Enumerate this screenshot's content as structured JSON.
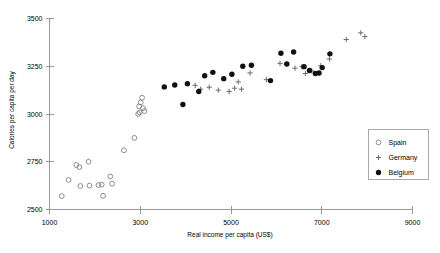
{
  "chart_data": {
    "type": "scatter",
    "title": "",
    "xlabel": "Real income per capita (US$)",
    "ylabel": "Calories per capita per day",
    "xlim": [
      1000,
      9000
    ],
    "ylim": [
      2500,
      3500
    ],
    "xticks": [
      1000,
      3000,
      5000,
      7000,
      9000
    ],
    "yticks": [
      2500,
      2750,
      3000,
      3250,
      3500
    ],
    "xtick_labels": [
      "1000",
      "3000",
      "5000",
      "7000",
      "9000"
    ],
    "ytick_labels": [
      "2500",
      "2750",
      "3000",
      "3250",
      "3500"
    ],
    "grid": false,
    "legend_position": "right-middle",
    "series": [
      {
        "name": "Spain",
        "marker": "open-circle",
        "color": "#8c8c8c",
        "points": [
          [
            1270,
            2570
          ],
          [
            1420,
            2655
          ],
          [
            1590,
            2733
          ],
          [
            1660,
            2722
          ],
          [
            1680,
            2623
          ],
          [
            1860,
            2750
          ],
          [
            1880,
            2625
          ],
          [
            2080,
            2628
          ],
          [
            2150,
            2630
          ],
          [
            2180,
            2572
          ],
          [
            2340,
            2673
          ],
          [
            2380,
            2635
          ],
          [
            2640,
            2810
          ],
          [
            2870,
            2875
          ],
          [
            2955,
            3000
          ],
          [
            2975,
            3040
          ],
          [
            2985,
            3008
          ],
          [
            3010,
            3060
          ],
          [
            3040,
            3085
          ],
          [
            3060,
            3030
          ],
          [
            3090,
            3015
          ]
        ]
      },
      {
        "name": "Germany",
        "marker": "plus",
        "color": "#6b6b6b",
        "points": [
          [
            4210,
            3150
          ],
          [
            4330,
            3130
          ],
          [
            4520,
            3140
          ],
          [
            4720,
            3125
          ],
          [
            4960,
            3118
          ],
          [
            5080,
            3135
          ],
          [
            5160,
            3168
          ],
          [
            5230,
            3130
          ],
          [
            5420,
            3215
          ],
          [
            5780,
            3180
          ],
          [
            6080,
            3265
          ],
          [
            6220,
            3262
          ],
          [
            6410,
            3240
          ],
          [
            6560,
            3248
          ],
          [
            6640,
            3212
          ],
          [
            6780,
            3225
          ],
          [
            6980,
            3253
          ],
          [
            7170,
            3288
          ],
          [
            7540,
            3390
          ],
          [
            7860,
            3425
          ],
          [
            7950,
            3405
          ]
        ]
      },
      {
        "name": "Belgium",
        "marker": "filled-circle",
        "color": "#111111",
        "points": [
          [
            3530,
            3142
          ],
          [
            3760,
            3152
          ],
          [
            3940,
            3050
          ],
          [
            4040,
            3158
          ],
          [
            4290,
            3118
          ],
          [
            4420,
            3200
          ],
          [
            4600,
            3218
          ],
          [
            4840,
            3185
          ],
          [
            5020,
            3208
          ],
          [
            5260,
            3250
          ],
          [
            5450,
            3255
          ],
          [
            5870,
            3175
          ],
          [
            6100,
            3318
          ],
          [
            6230,
            3262
          ],
          [
            6380,
            3325
          ],
          [
            6610,
            3248
          ],
          [
            6730,
            3228
          ],
          [
            6860,
            3212
          ],
          [
            6940,
            3215
          ],
          [
            7010,
            3243
          ],
          [
            7180,
            3315
          ]
        ]
      }
    ],
    "legend_entries": [
      {
        "label": "Spain",
        "marker": "open-circle"
      },
      {
        "label": "Germany",
        "marker": "plus"
      },
      {
        "label": "Belgium",
        "marker": "filled-circle"
      }
    ]
  }
}
